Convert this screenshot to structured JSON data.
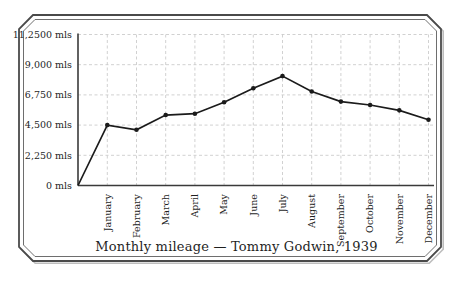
{
  "window": {
    "background": "#ffffff"
  },
  "frame": {
    "main_color": "#4a4a4a",
    "inner_color": "#6e6e6e",
    "shadow_color": "#bdbdbd"
  },
  "chart_data": {
    "type": "line",
    "title": "Monthly mileage — Tommy Godwin, 1939",
    "categories": [
      "January",
      "February",
      "March",
      "April",
      "May",
      "June",
      "July",
      "August",
      "September",
      "October",
      "November",
      "December"
    ],
    "series": [
      {
        "name": "Monthly mileage",
        "values": [
          4500,
          4150,
          5250,
          5350,
          6200,
          7250,
          8150,
          7000,
          6250,
          6000,
          5600,
          4900
        ]
      }
    ],
    "line_starts_at_origin": true,
    "y_axis": {
      "range": [
        0,
        11250
      ],
      "ticks": [
        {
          "value": 0,
          "label": "0 mls"
        },
        {
          "value": 2250,
          "label": "2,250 mls"
        },
        {
          "value": 4500,
          "label": "4,500 mls"
        },
        {
          "value": 6750,
          "label": "6,750 mls"
        },
        {
          "value": 9000,
          "label": "9,000 mls"
        },
        {
          "value": 11250,
          "label": "11,2500 mls"
        }
      ]
    },
    "x_axis": {
      "label_rotation_degrees": -90
    },
    "grid": {
      "visible": true,
      "style": "dashed",
      "color": "#cccccc"
    },
    "legend": {
      "visible": false
    },
    "line_color": "#1b1b1b",
    "marker": {
      "shape": "dot",
      "color": "#1b1b1b"
    },
    "axis_color": "#3a3a3a",
    "text_color": "#1f1f1f"
  }
}
